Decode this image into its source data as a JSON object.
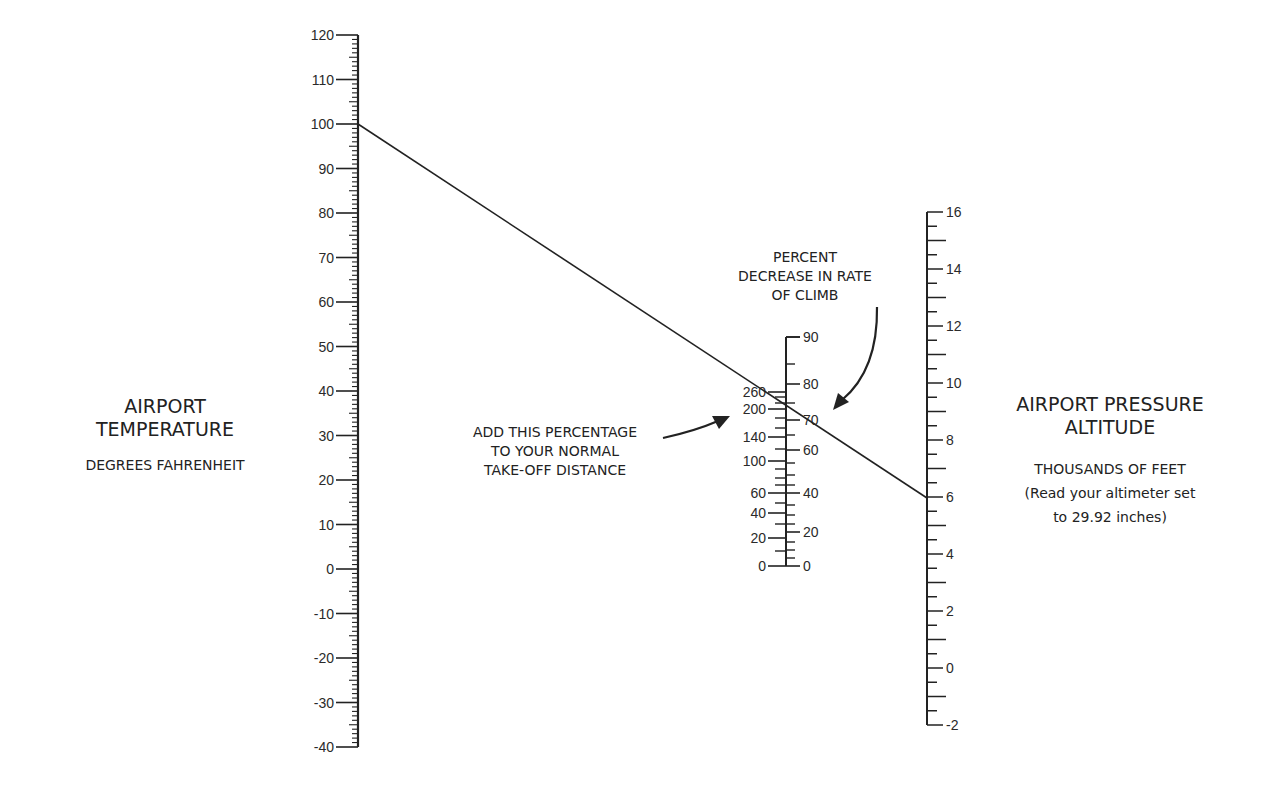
{
  "chart_data": {
    "type": "nomogram",
    "scales": [
      {
        "name": "temperature",
        "label": "AIRPORT TEMPERATURE",
        "sublabel": "DEGREES FAHRENHEIT",
        "min": -40,
        "max": 120,
        "major_step": 10,
        "minor_step": 1,
        "ticks": [
          120,
          110,
          100,
          90,
          80,
          70,
          60,
          50,
          40,
          30,
          20,
          10,
          0,
          -10,
          -20,
          -30,
          -40
        ]
      },
      {
        "name": "effect",
        "left_label": "ADD THIS PERCENTAGE TO YOUR NORMAL TAKE-OFF DISTANCE",
        "right_label": "PERCENT DECREASE IN RATE OF CLIMB",
        "left_ticks": [
          260,
          200,
          140,
          100,
          60,
          40,
          20,
          0
        ],
        "right_ticks": [
          90,
          80,
          70,
          60,
          40,
          20,
          0
        ]
      },
      {
        "name": "pressure_altitude",
        "label": "AIRPORT PRESSURE ALTITUDE",
        "sublabel": "THOUSANDS OF FEET",
        "note": "(Read your altimeter set to 29.92 inches)",
        "min": -2,
        "max": 16,
        "major_step": 2,
        "minor_step": 0.5,
        "ticks": [
          16,
          14,
          12,
          10,
          8,
          6,
          4,
          2,
          0,
          -2
        ]
      }
    ],
    "example_line": {
      "temperature_F": 100,
      "pressure_altitude_kft": 6,
      "takeoff_distance_increase_pct": 230,
      "rate_of_climb_decrease_pct": 76
    }
  },
  "labels": {
    "temp_title_1": "AIRPORT",
    "temp_title_2": "TEMPERATURE",
    "temp_sub": "DEGREES FAHRENHEIT",
    "alt_title_1": "AIRPORT PRESSURE",
    "alt_title_2": "ALTITUDE",
    "alt_sub": "THOUSANDS OF FEET",
    "alt_note_1": "(Read your altimeter set",
    "alt_note_2": "to 29.92 inches)",
    "takeoff_1": "ADD THIS PERCENTAGE",
    "takeoff_2": "TO YOUR NORMAL",
    "takeoff_3": "TAKE-OFF DISTANCE",
    "climb_1": "PERCENT",
    "climb_2": "DECREASE IN RATE",
    "climb_3": "OF CLIMB"
  }
}
